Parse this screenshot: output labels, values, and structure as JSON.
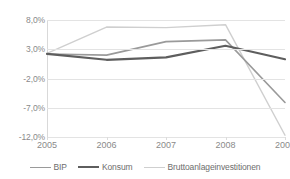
{
  "chart_data": {
    "type": "line",
    "title": "",
    "xlabel": "",
    "ylabel": "",
    "categories": [
      "2005",
      "2006",
      "2007",
      "2008",
      "2009"
    ],
    "ylim": [
      -12.0,
      8.0
    ],
    "yticks": [
      "8,0%",
      "3,0%",
      "-2,0%",
      "-7,0%",
      "-12,0%"
    ],
    "ytick_values": [
      8.0,
      3.0,
      -2.0,
      -7.0,
      -12.0
    ],
    "grid": true,
    "legend_position": "bottom",
    "series": [
      {
        "name": "BIP",
        "color": "#9a9a9a",
        "width": 1.6,
        "values": [
          2.2,
          2.0,
          4.3,
          4.6,
          -6.1
        ]
      },
      {
        "name": "Konsum",
        "color": "#5e5e5e",
        "width": 2.2,
        "values": [
          2.2,
          1.2,
          1.6,
          3.6,
          1.3
        ]
      },
      {
        "name": "Bruttoanlageinvestitionen",
        "color": "#cfcfcf",
        "width": 1.4,
        "values": [
          2.3,
          6.8,
          6.7,
          7.2,
          -11.7
        ]
      }
    ]
  }
}
